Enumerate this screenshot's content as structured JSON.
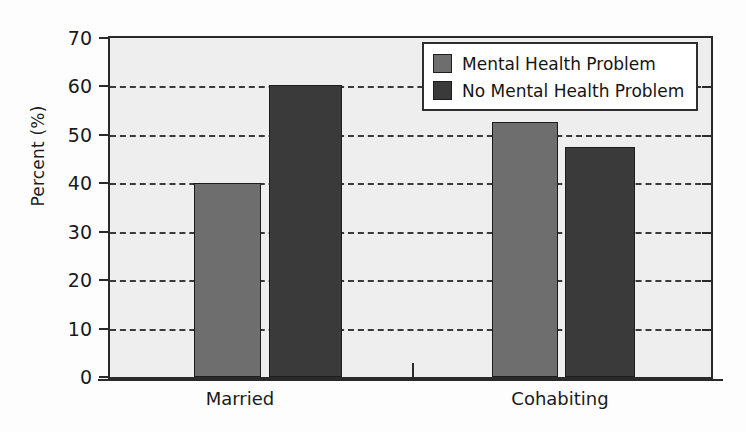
{
  "chart_data": {
    "type": "bar",
    "title": "",
    "xlabel": "",
    "ylabel": "Percent (%)",
    "categories": [
      "Married",
      "Cohabiting"
    ],
    "series": [
      {
        "name": "Mental Health Problem",
        "color": "#6e6e6e",
        "values": [
          40.0,
          52.7
        ]
      },
      {
        "name": "No Mental Health Problem",
        "color": "#3a3a3a",
        "values": [
          60.3,
          47.5
        ]
      }
    ],
    "ylim": [
      0,
      70
    ],
    "yticks": [
      0,
      10,
      20,
      30,
      40,
      50,
      60,
      70
    ],
    "ytick_labels": [
      "0",
      "10",
      "20",
      "30",
      "40",
      "50",
      "60",
      "70"
    ],
    "grid": true,
    "grid_style": "dashed-horizontal",
    "legend_position": "top-right",
    "plot_background": "#eeeeee"
  },
  "axis": {
    "y_title": "Percent (%)"
  },
  "legend": {
    "entries": [
      {
        "label": "Mental Health Problem",
        "color": "#6e6e6e"
      },
      {
        "label": "No Mental Health Problem",
        "color": "#3a3a3a"
      }
    ]
  }
}
